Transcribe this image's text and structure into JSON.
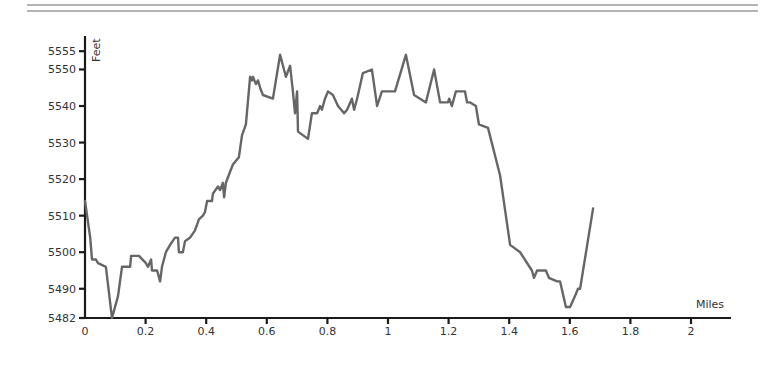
{
  "chart_data": {
    "type": "line",
    "title": "",
    "xlabel": "Miles",
    "ylabel": "Feet",
    "xlim": [
      0,
      2.13
    ],
    "ylim": [
      5482,
      5555
    ],
    "grid": false,
    "legend": null,
    "x_ticks": [
      0,
      0.2,
      0.4,
      0.6,
      0.8,
      1,
      1.2,
      1.4,
      1.6,
      1.8,
      2
    ],
    "x_tick_labels": [
      "0",
      "0.2",
      "0.4",
      "0.6",
      "0.8",
      "1",
      "1.2",
      "1.4",
      "1.6",
      "1.8",
      "2"
    ],
    "y_ticks": [
      5482,
      5490,
      5500,
      5510,
      5520,
      5530,
      5540,
      5550,
      5555
    ],
    "y_tick_labels": [
      "5482",
      "5490",
      "5500",
      "5510",
      "5520",
      "5530",
      "5540",
      "5550",
      "5555"
    ],
    "line_color": "#666666",
    "series": [
      {
        "name": "Elevation",
        "x": [
          0.0,
          0.017,
          0.023,
          0.036,
          0.043,
          0.069,
          0.086,
          0.089,
          0.109,
          0.122,
          0.149,
          0.152,
          0.178,
          0.201,
          0.208,
          0.218,
          0.221,
          0.238,
          0.248,
          0.254,
          0.267,
          0.281,
          0.297,
          0.307,
          0.31,
          0.323,
          0.33,
          0.347,
          0.363,
          0.376,
          0.389,
          0.396,
          0.403,
          0.419,
          0.422,
          0.439,
          0.446,
          0.455,
          0.459,
          0.465,
          0.479,
          0.488,
          0.508,
          0.518,
          0.531,
          0.545,
          0.551,
          0.554,
          0.564,
          0.571,
          0.578,
          0.587,
          0.62,
          0.644,
          0.663,
          0.677,
          0.686,
          0.693,
          0.7,
          0.703,
          0.736,
          0.749,
          0.766,
          0.776,
          0.782,
          0.792,
          0.802,
          0.818,
          0.835,
          0.855,
          0.865,
          0.881,
          0.888,
          0.898,
          0.917,
          0.947,
          0.964,
          0.98,
          1.023,
          1.059,
          1.086,
          1.125,
          1.152,
          1.172,
          1.198,
          1.202,
          1.211,
          1.224,
          1.254,
          1.261,
          1.271,
          1.29,
          1.3,
          1.33,
          1.37,
          1.403,
          1.436,
          1.475,
          1.482,
          1.492,
          1.502,
          1.521,
          1.531,
          1.558,
          1.568,
          1.587,
          1.601,
          1.617,
          1.627,
          1.634,
          1.677
        ],
        "y": [
          5514,
          5504,
          5498,
          5498,
          5497,
          5496,
          5484,
          5482,
          5488,
          5496,
          5496,
          5499,
          5499,
          5497,
          5496,
          5498,
          5495,
          5495,
          5492,
          5496,
          5500,
          5502,
          5504,
          5504,
          5500,
          5500,
          5503,
          5504,
          5506,
          5509,
          5510,
          5511,
          5514,
          5514,
          5516,
          5518,
          5517,
          5519,
          5515,
          5519,
          5522,
          5524,
          5526,
          5532,
          5535,
          5548,
          5547,
          5548,
          5546,
          5547,
          5545,
          5543,
          5542,
          5554,
          5548,
          5551,
          5544,
          5538,
          5544,
          5533,
          5531,
          5538,
          5538,
          5540,
          5539,
          5542,
          5544,
          5543,
          5540,
          5538,
          5539,
          5542,
          5539,
          5542,
          5549,
          5550,
          5540,
          5544,
          5544,
          5554,
          5543,
          5541,
          5550,
          5541,
          5541,
          5542,
          5540,
          5544,
          5544,
          5541,
          5541,
          5540,
          5535,
          5534,
          5521,
          5502,
          5500,
          5495,
          5493,
          5495,
          5495,
          5495,
          5493,
          5492,
          5492,
          5485,
          5485,
          5488,
          5490,
          5490,
          5512
        ]
      }
    ]
  },
  "plot": {
    "x_axis_title": "Miles",
    "y_axis_title": "Feet"
  }
}
